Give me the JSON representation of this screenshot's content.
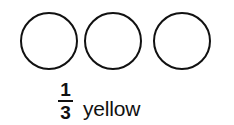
{
  "worksheet_item": {
    "shapes": {
      "icon_name": "circle-outline",
      "count": 3,
      "shaded_count": 0,
      "outline_color": "#111111",
      "fill_color": "#ffffff",
      "items": [
        {
          "label": "circle-1",
          "shaded": false
        },
        {
          "label": "circle-2",
          "shaded": false
        },
        {
          "label": "circle-3",
          "shaded": false
        }
      ]
    },
    "caption": {
      "fraction": {
        "numerator": "1",
        "denominator": "3",
        "plain_text": "1/3"
      },
      "color_word": "yellow",
      "full_text": "1/3 yellow"
    }
  },
  "page": {
    "background_color": "#ffffff",
    "text_color": "#111111"
  }
}
